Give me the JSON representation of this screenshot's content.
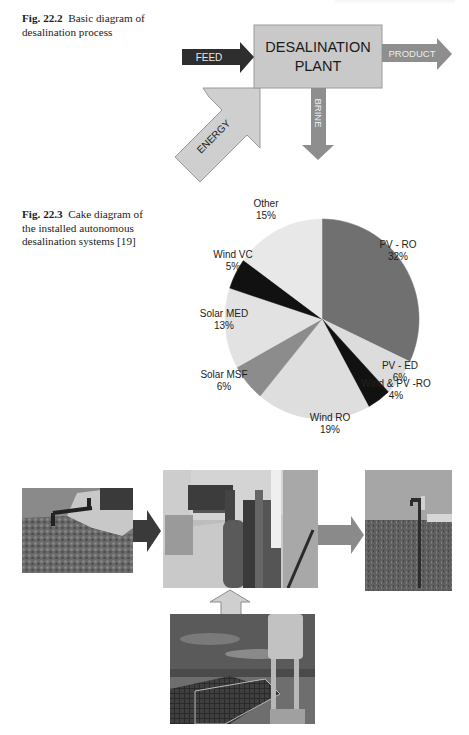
{
  "figures": {
    "fig_22_2": {
      "label": "Fig. 22.2",
      "caption": "Basic diagram of desalination process",
      "caption_line1": "Basic diagram of",
      "caption_line2": "desalination process",
      "diagram": {
        "box_line1": "DESALINATION",
        "box_line2": "PLANT",
        "arrows": {
          "feed": "FEED",
          "product": "PRODUCT",
          "brine": "BRINE",
          "energy": "ENERGY"
        },
        "colors": {
          "box": "#c9c9c9",
          "feed": "#2e2e2e",
          "product": "#8e8e8e",
          "brine": "#8e8e8e",
          "energy": "#cfcfcf"
        }
      }
    },
    "fig_22_3": {
      "label": "Fig. 22.3",
      "caption": "Cake diagram of the installed autonomous desalination systems [19]",
      "caption_line1": "Cake diagram of",
      "caption_line2": "the installed autonomous",
      "caption_line3": "desalination systems [19]"
    },
    "photo_flow": {
      "photos": [
        {
          "name": "well-pump",
          "description": "Well head with pipe on concrete base"
        },
        {
          "name": "ro-plant-room",
          "description": "Indoor reverse osmosis desalination unit"
        },
        {
          "name": "water-tap",
          "description": "Outdoor water tap on a pole"
        },
        {
          "name": "pv-array",
          "description": "Solar PV panels with control cabinet"
        }
      ],
      "arrow_colors": {
        "dark": "#3a3a3a",
        "medium": "#8a8a8a",
        "light": "#cfcfcf"
      }
    }
  },
  "chart_data": {
    "type": "pie",
    "title": "Cake diagram of the installed autonomous desalination systems",
    "start": "12 o'clock",
    "direction": "clockwise",
    "slices": [
      {
        "label": "PV - RO",
        "value": 32,
        "pct_label": "32%",
        "color": "#707070"
      },
      {
        "label": "PV - ED",
        "value": 6,
        "pct_label": "6%",
        "color": "#dcdcdc"
      },
      {
        "label": "Wind & PV -RO",
        "value": 4,
        "pct_label": "4%",
        "color": "#111111"
      },
      {
        "label": "Wind RO",
        "value": 19,
        "pct_label": "19%",
        "color": "#dedede"
      },
      {
        "label": "Solar MSF",
        "value": 6,
        "pct_label": "6%",
        "color": "#8c8c8c"
      },
      {
        "label": "Solar MED",
        "value": 13,
        "pct_label": "13%",
        "color": "#e2e2e2"
      },
      {
        "label": "Wind VC",
        "value": 5,
        "pct_label": "5%",
        "color": "#111111"
      },
      {
        "label": "Other",
        "value": 15,
        "pct_label": "15%",
        "color": "#e8e8e8"
      }
    ],
    "legend": "none (labels placed outside slices)",
    "units": "%"
  }
}
